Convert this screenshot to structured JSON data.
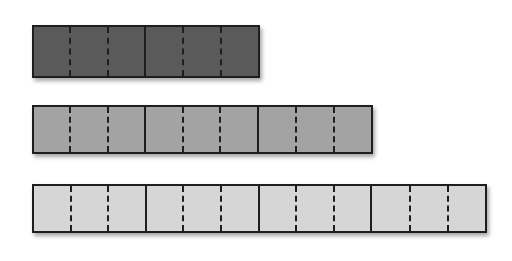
{
  "diagram": {
    "bars": [
      {
        "id": "bar-1",
        "sections": 2,
        "subdivisions_per_section": 3,
        "fill_color": "#5a5a5a",
        "top": 25,
        "width": 228,
        "height": 53
      },
      {
        "id": "bar-2",
        "sections": 3,
        "subdivisions_per_section": 3,
        "fill_color": "#a3a3a3",
        "top": 105,
        "width": 341,
        "height": 49
      },
      {
        "id": "bar-3",
        "sections": 4,
        "subdivisions_per_section": 3,
        "fill_color": "#d6d6d6",
        "top": 184,
        "width": 455,
        "height": 49
      }
    ],
    "border_color": "#1e1e1e"
  }
}
